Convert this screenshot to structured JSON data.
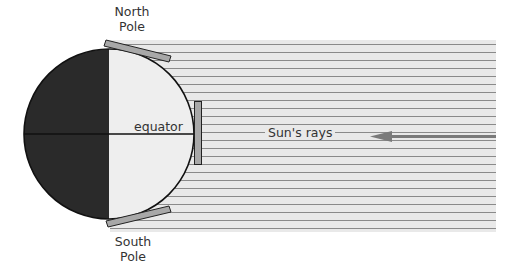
{
  "diagram": {
    "labels": {
      "north_pole_line1": "North",
      "north_pole_line2": "Pole",
      "south_pole_line1": "South",
      "south_pole_line2": "Pole",
      "equator": "equator",
      "sun_rays": "Sun's rays"
    },
    "colors": {
      "background": "#ffffff",
      "ray_band": "#e9e9e9",
      "ray_lines": "#8a8a8a",
      "earth_night": "#2a2a2a",
      "earth_day": "#eeeeee",
      "outline": "#111111",
      "panels": "#a8a8a8",
      "arrow": "#7a7a7a"
    },
    "geometry": {
      "earth_center": [
        109,
        134
      ],
      "earth_radius": 85,
      "ray_band": {
        "x": 110,
        "y": 40,
        "width": 386,
        "height": 192
      },
      "ray_spacing": 8
    }
  }
}
